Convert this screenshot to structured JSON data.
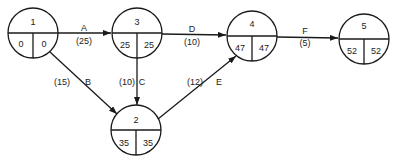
{
  "colors": {
    "stroke": "#1a1a1a",
    "text": "#222222",
    "background": "#ffffff"
  },
  "nodes": [
    {
      "id": "1",
      "es": "0",
      "ls": "0",
      "cx": 33,
      "cy": 33
    },
    {
      "id": "3",
      "es": "25",
      "ls": "25",
      "cx": 137,
      "cy": 33
    },
    {
      "id": "4",
      "es": "47",
      "ls": "47",
      "cx": 252,
      "cy": 36
    },
    {
      "id": "5",
      "es": "52",
      "ls": "52",
      "cx": 364,
      "cy": 39
    },
    {
      "id": "2",
      "es": "35",
      "ls": "35",
      "cx": 136,
      "cy": 131
    }
  ],
  "activities": [
    {
      "name": "A",
      "duration": "(25)",
      "from": "1",
      "to": "3"
    },
    {
      "name": "B",
      "duration": "(15)",
      "from": "1",
      "to": "2"
    },
    {
      "name": "C",
      "duration": "(10)",
      "from": "3",
      "to": "2"
    },
    {
      "name": "D",
      "duration": "(10)",
      "from": "3",
      "to": "4"
    },
    {
      "name": "E",
      "duration": "(12)",
      "from": "2",
      "to": "4"
    },
    {
      "name": "F",
      "duration": "(5)",
      "from": "4",
      "to": "5"
    }
  ]
}
